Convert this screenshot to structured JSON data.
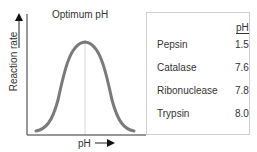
{
  "diagram": {
    "y_axis_label": "Reaction rate",
    "x_axis_label": "pH",
    "peak_label": "Optimum pH",
    "curve_color": "#7a7a7a",
    "axis_color": "#333333"
  },
  "table": {
    "header": "pH",
    "rows": [
      {
        "enzyme": "Pepsin",
        "ph": "1.5"
      },
      {
        "enzyme": "Catalase",
        "ph": "7.6"
      },
      {
        "enzyme": "Ribonuclease",
        "ph": "7.8"
      },
      {
        "enzyme": "Trypsin",
        "ph": "8.0"
      }
    ]
  }
}
